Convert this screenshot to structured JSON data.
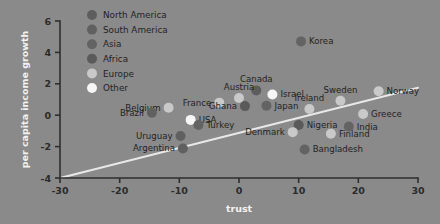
{
  "chart_data": {
    "type": "scatter",
    "title": "",
    "xlabel": "trust",
    "ylabel": "per capita income growth",
    "xlim": [
      -30,
      30
    ],
    "ylim": [
      -4,
      6
    ],
    "xticks": [
      "-30",
      "-20",
      "-10",
      "0",
      "10",
      "20",
      "30"
    ],
    "xtick_values": [
      -30,
      -20,
      -10,
      0,
      10,
      20,
      30
    ],
    "yticks": [
      "6",
      "4",
      "2",
      "0",
      "-2",
      "-4"
    ],
    "ytick_values": [
      6,
      4,
      2,
      0,
      -2,
      -4
    ],
    "grid": false,
    "legend_position": "top-left-inside",
    "trendline": {
      "x0": -30,
      "y0": -4.0,
      "x1": 30,
      "y1": 1.75,
      "color": "#e8e8e8"
    },
    "groups": [
      {
        "name": "North America",
        "color": "#5d5d5d"
      },
      {
        "name": "South America",
        "color": "#606060"
      },
      {
        "name": "Asia",
        "color": "#636363"
      },
      {
        "name": "Africa",
        "color": "#5a5a5a"
      },
      {
        "name": "Europe",
        "color": "#c9c9c9"
      },
      {
        "name": "Other",
        "color": "#f6f6f6"
      }
    ],
    "points": [
      {
        "label": "Korea",
        "x": 10.4,
        "y": 4.7,
        "group": "Asia",
        "label_side": "right"
      },
      {
        "label": "Canada",
        "x": 2.9,
        "y": 1.58,
        "group": "North America",
        "label_side": "above"
      },
      {
        "label": "Israel",
        "x": 5.6,
        "y": 1.32,
        "group": "Other",
        "label_side": "right"
      },
      {
        "label": "Norway",
        "x": 23.4,
        "y": 1.52,
        "group": "Europe",
        "label_side": "right"
      },
      {
        "label": "Sweden",
        "x": 17.0,
        "y": 0.92,
        "group": "Europe",
        "label_side": "above"
      },
      {
        "label": "Austria",
        "x": 0.0,
        "y": 1.1,
        "group": "Europe",
        "label_side": "above"
      },
      {
        "label": "France",
        "x": -3.3,
        "y": 0.8,
        "group": "Europe",
        "label_side": "left"
      },
      {
        "label": "Belgium",
        "x": -11.8,
        "y": 0.48,
        "group": "Europe",
        "label_side": "left"
      },
      {
        "label": "Brazil",
        "x": -14.6,
        "y": 0.16,
        "group": "South America",
        "label_side": "left"
      },
      {
        "label": "Ghana",
        "x": 1.0,
        "y": 0.58,
        "group": "Africa",
        "label_side": "left"
      },
      {
        "label": "Japan",
        "x": 4.6,
        "y": 0.6,
        "group": "Asia",
        "label_side": "right"
      },
      {
        "label": "Ireland",
        "x": 11.8,
        "y": 0.4,
        "group": "Europe",
        "label_side": "above"
      },
      {
        "label": "Greece",
        "x": 20.8,
        "y": 0.08,
        "group": "Europe",
        "label_side": "right"
      },
      {
        "label": "USA",
        "x": -8.1,
        "y": -0.3,
        "group": "Other",
        "label_side": "right"
      },
      {
        "label": "Turkey",
        "x": -6.8,
        "y": -0.62,
        "group": "Asia",
        "label_side": "right"
      },
      {
        "label": "Nigeria",
        "x": 10.0,
        "y": -0.62,
        "group": "Africa",
        "label_side": "right"
      },
      {
        "label": "India",
        "x": 18.4,
        "y": -0.72,
        "group": "Asia",
        "label_side": "right"
      },
      {
        "label": "Denmark",
        "x": 9.0,
        "y": -1.08,
        "group": "Europe",
        "label_side": "left"
      },
      {
        "label": "Finland",
        "x": 15.4,
        "y": -1.18,
        "group": "Europe",
        "label_side": "right"
      },
      {
        "label": "Uruguay",
        "x": -9.8,
        "y": -1.32,
        "group": "South America",
        "label_side": "left"
      },
      {
        "label": "Argentina",
        "x": -9.4,
        "y": -2.12,
        "group": "South America",
        "label_side": "left"
      },
      {
        "label": "Bangladesh",
        "x": 11.0,
        "y": -2.18,
        "group": "Asia",
        "label_side": "right"
      }
    ]
  }
}
